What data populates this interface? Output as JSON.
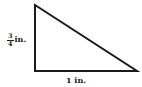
{
  "diagram": {
    "shape": "right-triangle",
    "vertices": {
      "top": [
        35,
        5
      ],
      "right_angle": [
        35,
        71
      ],
      "base_end": [
        137,
        71
      ]
    },
    "stroke_color": "#1a1a1a",
    "fill_color": "#ffffff",
    "labels": {
      "vertical_side": {
        "numerator": "3",
        "denominator": "4",
        "unit": "in."
      },
      "base": {
        "text": "1 in."
      }
    }
  }
}
